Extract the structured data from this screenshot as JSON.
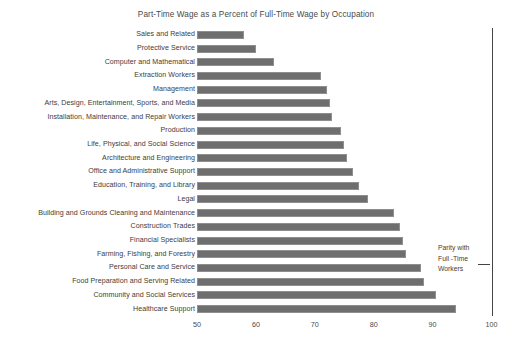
{
  "chart_data": {
    "type": "bar",
    "orientation": "horizontal",
    "title": "Part-Time Wage as a Percent of Full-Time Wage by Occupation",
    "xlabel": "",
    "ylabel": "",
    "xlim": [
      50,
      100
    ],
    "xticks": [
      50,
      60,
      70,
      80,
      90,
      100
    ],
    "grid": false,
    "legend": "none",
    "bar_color": "#6e6e6e",
    "categories": [
      "Sales and Related",
      "Protective Service",
      "Computer and Mathematical",
      "Extraction Workers",
      "Management",
      "Arts, Design, Entertainment, Sports, and Media",
      "Installation, Maintenance, and Repair Workers",
      "Production",
      "Life, Physical, and Social Science",
      "Architecture and Engineering",
      "Office and Administrative Support",
      "Education, Training, and Library",
      "Legal",
      "Building and Grounds Cleaning and Maintenance",
      "Construction Trades",
      "Financial Specialists",
      "Farming, Fishing, and Forestry",
      "Personal Care and Service",
      "Food Preparation and Serving Related",
      "Community and Social Services",
      "Healthcare Support"
    ],
    "values": [
      58,
      60,
      63,
      71,
      72,
      72.5,
      73,
      74.5,
      75,
      75.5,
      76.5,
      77.5,
      79,
      83.5,
      84.5,
      85,
      85.5,
      88,
      88.5,
      90.5,
      94
    ],
    "annotations": [
      {
        "name": "parity-reference-line",
        "value": 100,
        "label_lines": [
          "Parity with",
          "Full -Time",
          "Workers"
        ]
      }
    ]
  }
}
